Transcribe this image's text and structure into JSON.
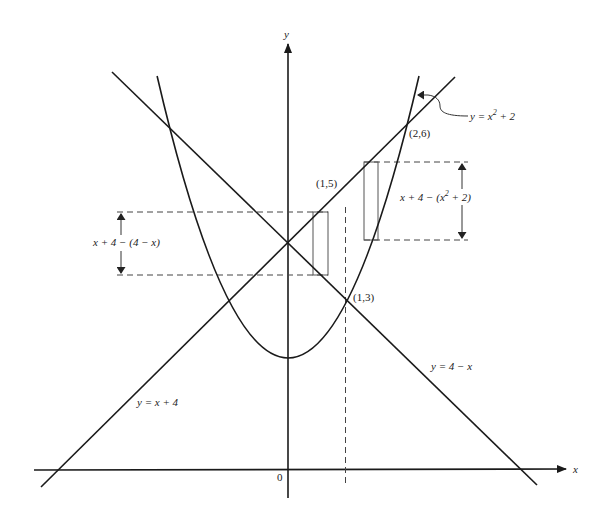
{
  "diagram": {
    "axes": {
      "x_label": "x",
      "y_label": "y",
      "origin_label": "0"
    },
    "curves": [
      {
        "name": "parabola",
        "equation": "y = x² + 2",
        "label_prefix": "y = x",
        "label_sup": "2",
        "label_suffix": " + 2"
      },
      {
        "name": "line-rising",
        "equation": "y = x + 4",
        "label": "y = x + 4"
      },
      {
        "name": "line-falling",
        "equation": "y = 4 − x",
        "label": "y = 4 − x"
      }
    ],
    "points": [
      {
        "label": "(1,5)",
        "x": 1,
        "y": 5
      },
      {
        "label": "(1,3)",
        "x": 1,
        "y": 3
      },
      {
        "label": "(2,6)",
        "x": 2,
        "y": 6
      }
    ],
    "annotations": {
      "left_height_label": "x + 4 − (4 − x)",
      "right_height_prefix": "x + 4 − (x",
      "right_height_sup": "2",
      "right_height_suffix": " + 2)"
    },
    "divider": {
      "x": 1,
      "style": "dashed"
    }
  }
}
